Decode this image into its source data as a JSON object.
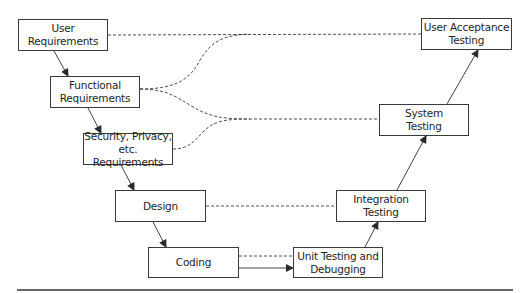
{
  "diagram": {
    "type": "V-model software development lifecycle",
    "colors": {
      "line": "#3a3a3a",
      "text": "#1e1e1e",
      "background": "#ffffff"
    },
    "nodes": [
      {
        "id": "user_req",
        "label": "User\nRequirements",
        "x": 18,
        "y": 19,
        "w": 90,
        "h": 32
      },
      {
        "id": "func_req",
        "label": "Functional\nRequirements",
        "x": 50,
        "y": 76,
        "w": 90,
        "h": 32
      },
      {
        "id": "sec_req",
        "label": "Security, Privacy,\netc. Requirements",
        "x": 83,
        "y": 133,
        "w": 90,
        "h": 32
      },
      {
        "id": "design",
        "label": "Design",
        "x": 115,
        "y": 190,
        "w": 91,
        "h": 32
      },
      {
        "id": "coding",
        "label": "Coding",
        "x": 148,
        "y": 247,
        "w": 91,
        "h": 31
      },
      {
        "id": "unit_test",
        "label": "Unit Testing and\nDebugging",
        "x": 293,
        "y": 247,
        "w": 90,
        "h": 31
      },
      {
        "id": "integ_test",
        "label": "Integration\nTesting",
        "x": 336,
        "y": 190,
        "w": 90,
        "h": 32
      },
      {
        "id": "sys_test",
        "label": "System\nTesting",
        "x": 379,
        "y": 104,
        "w": 90,
        "h": 32
      },
      {
        "id": "uat",
        "label": "User Acceptance\nTesting",
        "x": 421,
        "y": 18,
        "w": 91,
        "h": 32
      }
    ],
    "solid_arrows": [
      {
        "from": "user_req",
        "to": "func_req"
      },
      {
        "from": "func_req",
        "to": "sec_req"
      },
      {
        "from": "sec_req",
        "to": "design"
      },
      {
        "from": "design",
        "to": "coding"
      },
      {
        "from": "coding",
        "to": "unit_test"
      },
      {
        "from": "unit_test",
        "to": "integ_test"
      },
      {
        "from": "integ_test",
        "to": "sys_test"
      },
      {
        "from": "sys_test",
        "to": "uat"
      }
    ],
    "dashed_links": [
      {
        "from": "user_req",
        "to": "uat"
      },
      {
        "from": "func_req",
        "to": "uat"
      },
      {
        "from": "func_req",
        "to": "sys_test"
      },
      {
        "from": "sec_req",
        "to": "sys_test"
      },
      {
        "from": "design",
        "to": "integ_test"
      },
      {
        "from": "coding",
        "to": "unit_test"
      }
    ],
    "bottom_rule": {
      "x1": 17,
      "x2": 513,
      "y": 290
    }
  }
}
